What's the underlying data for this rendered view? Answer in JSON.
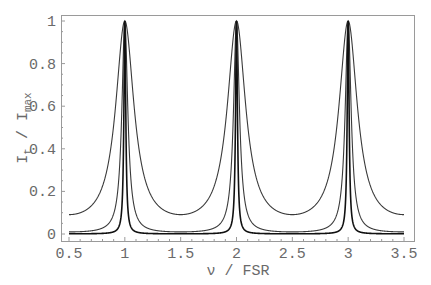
{
  "chart_data": {
    "type": "line",
    "title": "",
    "xlabel": "ν / FSR",
    "ylabel": "I_t / I_max",
    "ylabel_parts": {
      "main": "I",
      "sub1": "t",
      "sep": " / ",
      "main2": "I",
      "sub2": "max"
    },
    "xlim": [
      0.5,
      3.5
    ],
    "ylim": [
      0,
      1
    ],
    "grid": false,
    "legend": null,
    "x_ticks": [
      0.5,
      1,
      1.5,
      2,
      2.5,
      3,
      3.5
    ],
    "x_tick_labels": [
      "0.5",
      "1",
      "1.5",
      "2",
      "2.5",
      "3",
      "3.5"
    ],
    "y_ticks": [
      0,
      0.2,
      0.4,
      0.6,
      0.8,
      1
    ],
    "y_tick_labels": [
      "0",
      "0.2",
      "0.4",
      "0.6",
      "0.8",
      "1"
    ],
    "function": "I_t/I_max = 1 / (1 + F sin^2(pi * nu/FSR))",
    "series": [
      {
        "name": "low finesse (F≈10)",
        "F": 10,
        "min_value": 0.091,
        "peak_positions": [
          1,
          2,
          3
        ],
        "peak_value": 1.0,
        "color": "#3a3a3a",
        "x": [
          0.5,
          0.75,
          0.9,
          0.95,
          1.0,
          1.05,
          1.1,
          1.25,
          1.5,
          1.75,
          1.9,
          1.95,
          2.0,
          2.05,
          2.1,
          2.25,
          2.5,
          2.75,
          2.9,
          2.95,
          3.0,
          3.05,
          3.1,
          3.25,
          3.5
        ],
        "values": [
          0.091,
          0.167,
          0.512,
          0.803,
          1.0,
          0.803,
          0.512,
          0.167,
          0.091,
          0.167,
          0.512,
          0.803,
          1.0,
          0.803,
          0.512,
          0.167,
          0.091,
          0.167,
          0.512,
          0.803,
          1.0,
          0.803,
          0.512,
          0.167,
          0.091
        ]
      },
      {
        "name": "medium finesse (F≈100)",
        "F": 100,
        "min_value": 0.0099,
        "peak_positions": [
          1,
          2,
          3
        ],
        "peak_value": 1.0,
        "color": "#3a3a3a",
        "x": [
          0.5,
          0.9,
          0.97,
          1.0,
          1.03,
          1.1,
          1.5,
          1.9,
          1.97,
          2.0,
          2.03,
          2.1,
          2.5,
          2.9,
          2.97,
          3.0,
          3.03,
          3.1,
          3.5
        ],
        "values": [
          0.0099,
          0.095,
          0.531,
          1.0,
          0.531,
          0.095,
          0.0099,
          0.095,
          0.531,
          1.0,
          0.531,
          0.095,
          0.0099,
          0.095,
          0.531,
          1.0,
          0.531,
          0.095,
          0.0099
        ]
      },
      {
        "name": "high finesse (F≈1000)",
        "F": 1000,
        "min_value": 0.001,
        "peak_positions": [
          1,
          2,
          3
        ],
        "peak_value": 1.0,
        "color": "#111111",
        "x": [
          0.5,
          0.95,
          0.99,
          1.0,
          1.01,
          1.05,
          1.5,
          1.95,
          1.99,
          2.0,
          2.01,
          2.05,
          2.5,
          2.95,
          2.99,
          3.0,
          3.01,
          3.05,
          3.5
        ],
        "values": [
          0.001,
          0.041,
          0.91,
          1.0,
          0.91,
          0.041,
          0.001,
          0.041,
          0.91,
          1.0,
          0.91,
          0.041,
          0.001,
          0.041,
          0.91,
          1.0,
          0.91,
          0.041,
          0.001
        ]
      }
    ]
  },
  "colors": {
    "frame": "#9a9a9a",
    "tick_text": "#6a6a6a",
    "curve": "#3a3a3a",
    "background": "#ffffff"
  }
}
